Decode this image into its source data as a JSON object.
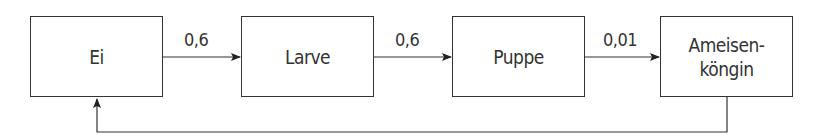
{
  "diagram": {
    "nodes": [
      {
        "id": "ei",
        "label": "Ei"
      },
      {
        "id": "larve",
        "label": "Larve"
      },
      {
        "id": "puppe",
        "label": "Puppe"
      },
      {
        "id": "koenigin",
        "label_line1": "Ameisen-",
        "label_line2": "köngin"
      }
    ],
    "edges": [
      {
        "from": "ei",
        "to": "larve",
        "label": "0,6"
      },
      {
        "from": "larve",
        "to": "puppe",
        "label": "0,6"
      },
      {
        "from": "puppe",
        "to": "koenigin",
        "label": "0,01"
      },
      {
        "from": "koenigin",
        "to": "ei",
        "label": ""
      }
    ]
  }
}
